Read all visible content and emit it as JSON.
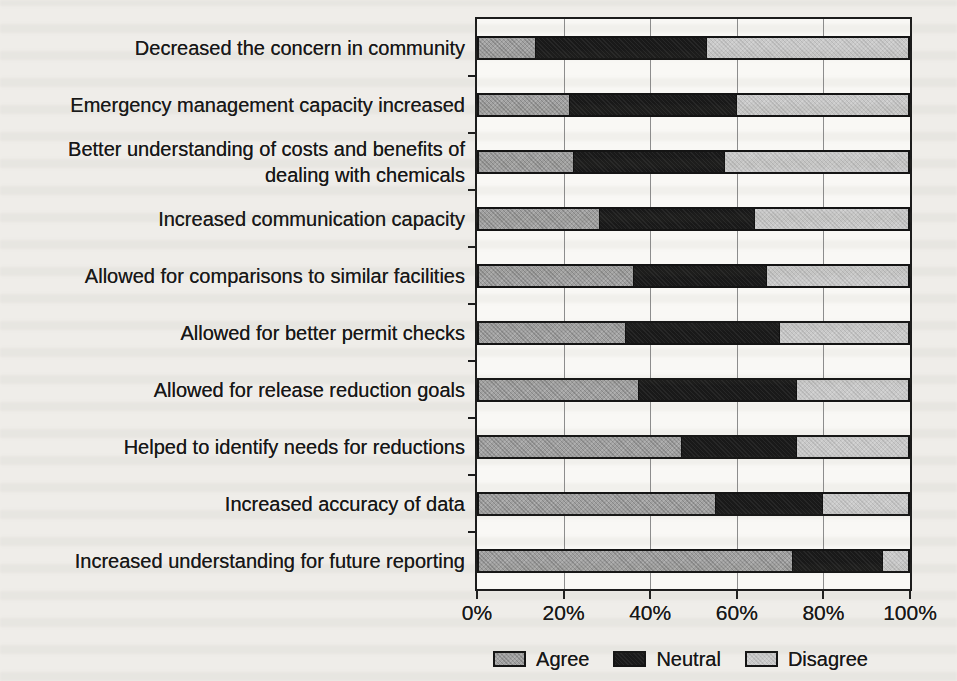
{
  "chart_data": {
    "type": "bar",
    "variant": "horizontal-stacked",
    "title": "",
    "xlabel": "",
    "ylabel": "",
    "xlim": [
      0,
      100
    ],
    "grid": true,
    "legend_position": "bottom",
    "x_ticks": [
      "0%",
      "20%",
      "40%",
      "60%",
      "80%",
      "100%"
    ],
    "categories": [
      "Decreased the concern in community",
      "Emergency management capacity increased",
      "Better understanding of costs and benefits of dealing with chemicals",
      "Increased communication capacity",
      "Allowed for comparisons to similar facilities",
      "Allowed for better permit checks",
      "Allowed for release reduction goals",
      "Helped to identify needs for reductions",
      "Increased accuracy of data",
      "Increased understanding for future reporting"
    ],
    "series": [
      {
        "name": "Agree",
        "color": "#a1a1a1",
        "values": [
          13,
          21,
          22,
          28,
          36,
          34,
          37,
          47,
          55,
          73
        ]
      },
      {
        "name": "Neutral",
        "color": "#191919",
        "values": [
          40,
          39,
          35,
          36,
          31,
          36,
          37,
          27,
          25,
          21
        ]
      },
      {
        "name": "Disagree",
        "color": "#c9c9c9",
        "values": [
          47,
          40,
          43,
          36,
          33,
          30,
          26,
          26,
          20,
          6
        ]
      }
    ]
  }
}
